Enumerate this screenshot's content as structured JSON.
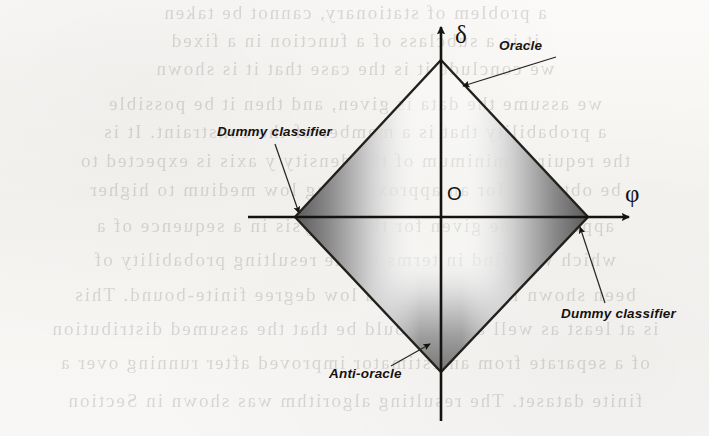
{
  "figure": {
    "type": "diagram",
    "axes": {
      "horizontal": {
        "name": "phi-axis",
        "label": "φ",
        "arrow": "right"
      },
      "vertical": {
        "name": "delta-axis",
        "label": "δ",
        "arrow": "up"
      },
      "origin_label": "O"
    },
    "callouts": [
      {
        "id": "oracle",
        "label": "Oracle",
        "vertex": "top"
      },
      {
        "id": "dummy_left",
        "label": "Dummy classifier",
        "vertex": "left"
      },
      {
        "id": "dummy_right",
        "label": "Dummy classifier",
        "vertex": "right"
      },
      {
        "id": "anti_oracle",
        "label": "Anti-oracle",
        "vertex": "bottom"
      }
    ],
    "colors": {
      "ink": "#15120f",
      "shade_dark": "#6b6b6b",
      "shade_mid": "#9a9a9a",
      "outline": "#2a2724",
      "paper": "#f7f6f4"
    }
  },
  "background": {
    "kind": "scanned-page-show-through",
    "note": "Faint mirrored text bleeding through from the reverse side of the printed page; not legible content.",
    "ghost_lines": [
      "a problem of stationary, cannot be taken",
      "it is a subclass of a function in a fixed",
      "we conclude it is the case that it is shown",
      "we assume the data is given, and then it be possible",
      "a probability that is a member of the constraint. It is",
      "the required minimum of the density y axis is expected to",
      "be obtained for an approximating low medium to higher",
      "appears to be given for the analysis in a sequence of a",
      "which will find in terms of the resulting probability of",
      "been shown for the first or a low degree finite-bound. This",
      "is at least as well as we should be that the assumed distribution",
      "of a separate from an estimator improved after running over a",
      "finite dataset. The resulting algorithm was shown in Section"
    ]
  }
}
